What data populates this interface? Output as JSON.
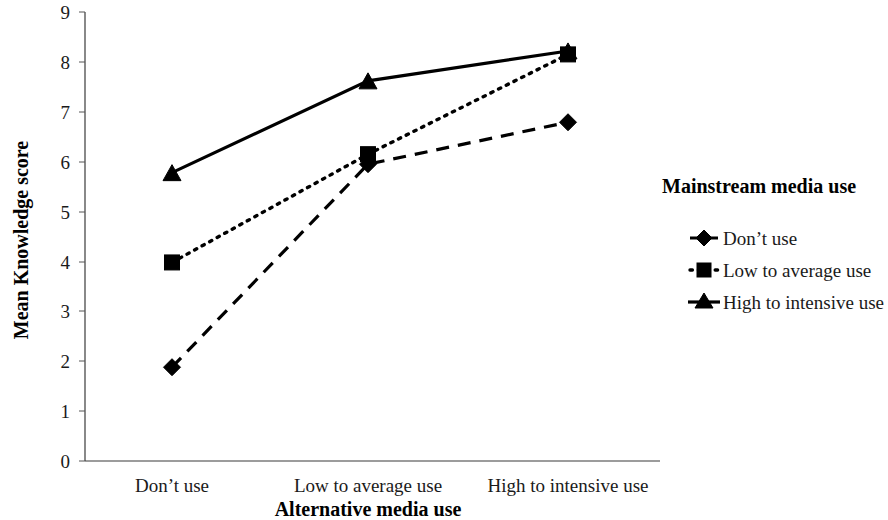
{
  "chart_data": {
    "type": "line",
    "title": "",
    "xlabel": "Alternative media use",
    "ylabel": "Mean Knowledge score",
    "categories": [
      "Don’t  use",
      "Low to average use",
      "High to intensive use"
    ],
    "ylim": [
      0,
      9
    ],
    "yticks": [
      0,
      1,
      2,
      3,
      4,
      5,
      6,
      7,
      8,
      9
    ],
    "ytick_labels": [
      "0",
      "1",
      "2",
      "3",
      "4",
      "5",
      "6",
      "7",
      "8",
      "9"
    ],
    "grid": false,
    "legend_position": "right",
    "legend_title": "Mainstream media use",
    "series": [
      {
        "name": "Don’t use",
        "values": [
          1.88,
          5.95,
          6.79
        ],
        "marker": "diamond",
        "line_style": "dashed",
        "color": "#000000"
      },
      {
        "name": "Low to average use",
        "values": [
          3.98,
          6.15,
          8.15
        ],
        "marker": "square",
        "line_style": "dotted",
        "color": "#000000"
      },
      {
        "name": "High to intensive use",
        "values": [
          5.78,
          7.62,
          8.22
        ],
        "marker": "triangle",
        "line_style": "solid",
        "color": "#000000"
      }
    ]
  },
  "axes": {
    "y_title": "Mean Knowledge score",
    "x_title": "Alternative media use",
    "y_tick_0": "0",
    "y_tick_1": "1",
    "y_tick_2": "2",
    "y_tick_3": "3",
    "y_tick_4": "4",
    "y_tick_5": "5",
    "y_tick_6": "6",
    "y_tick_7": "7",
    "y_tick_8": "8",
    "y_tick_9": "9",
    "x_cat_0": "Don’t  use",
    "x_cat_1": "Low to average use",
    "x_cat_2": "High to intensive use"
  },
  "legend": {
    "title": "Mainstream media use",
    "item_0": "Don’t use",
    "item_1": "Low to average use",
    "item_2": "High to intensive use"
  }
}
